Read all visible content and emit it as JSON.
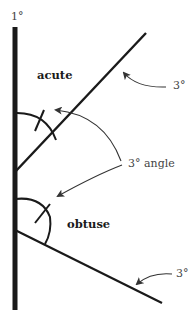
{
  "diagram": {
    "labels": {
      "line1": "1°",
      "upper_line": "3°",
      "angle": "3° angle",
      "lower_line": "3°",
      "acute": "acute",
      "obtuse": "obtuse"
    },
    "colors": {
      "line": "#1a1a1a",
      "text": "#222222",
      "label_thin": "#444444",
      "background": "#ffffff"
    },
    "elements": {
      "vertical_line": {
        "x": 15,
        "y1": 27,
        "y2": 310,
        "weight": "1°"
      },
      "upper_ray": {
        "from": [
          15,
          172
        ],
        "to": [
          146,
          33
        ],
        "weight": "3°"
      },
      "lower_ray": {
        "from": [
          15,
          230
        ],
        "to": [
          162,
          303
        ],
        "weight": "3°"
      },
      "acute_arc": {
        "vertex": [
          15,
          172
        ],
        "type": "acute"
      },
      "obtuse_arc": {
        "vertex": [
          15,
          230
        ],
        "type": "obtuse"
      }
    }
  }
}
